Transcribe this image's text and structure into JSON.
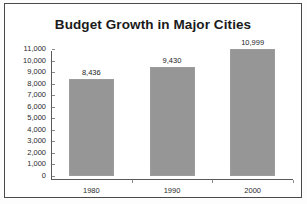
{
  "chart_data": {
    "type": "bar",
    "title": "Budget Growth in Major Cities",
    "categories": [
      "1980",
      "1990",
      "2000"
    ],
    "values": [
      8436,
      9430,
      10999
    ],
    "value_labels": [
      "8,436",
      "9,430",
      "10,999"
    ],
    "xlabel": "",
    "ylabel": "",
    "ylim": [
      0,
      11000
    ],
    "y_tick_step": 1000,
    "y_ticks": [
      11000,
      10000,
      9000,
      8000,
      7000,
      6000,
      5000,
      4000,
      3000,
      2000,
      1000,
      0
    ],
    "y_tick_labels": [
      "11,000",
      "10,000",
      "9,000",
      "8,000",
      "7,000",
      "6,000",
      "5,000",
      "4,000",
      "3,000",
      "2,000",
      "1,000",
      "0"
    ],
    "grid": false,
    "legend": false,
    "legend_position": "none",
    "bar_color": "#969696",
    "axis_color": "#5a5a5a",
    "text_color": "#1c1c1c",
    "frame_color": "#4a4a4a",
    "background": "#ffffff"
  }
}
